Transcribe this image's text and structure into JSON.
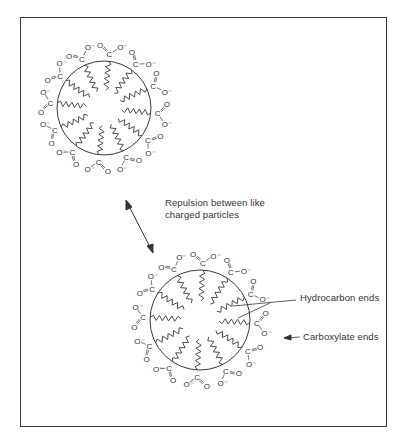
{
  "figure": {
    "type": "micelle-repulsion-diagram",
    "labels": {
      "repulsion_line1": "Repulsion between like",
      "repulsion_line2": "charged particles",
      "hydrocarbon": "Hydrocarbon ends",
      "carboxylate": "Carboxylate ends"
    },
    "micelles": [
      {
        "name": "top-micelle",
        "cx": 104,
        "cy": 108,
        "r": 47,
        "chains": 12
      },
      {
        "name": "bottom-micelle",
        "cx": 200,
        "cy": 320,
        "r": 50,
        "chains": 12
      }
    ],
    "head_group": {
      "carbon": "C",
      "double_O": "O",
      "single_O": "O⁻"
    },
    "colors": {
      "line": "#3a3a3a",
      "text": "#333333",
      "background": "#ffffff"
    }
  }
}
